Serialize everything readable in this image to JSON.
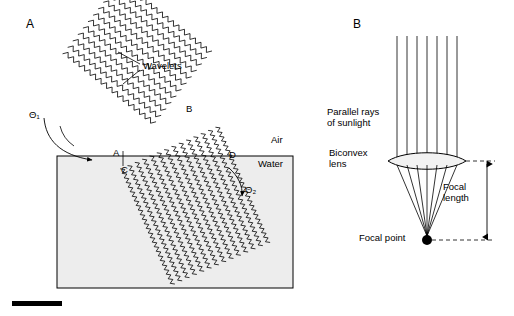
{
  "figure": {
    "width": 514,
    "height": 316,
    "background": "#ffffff",
    "ink": "#000000",
    "water_fill": "#ededed",
    "lens_fill": "#f2f2f2"
  },
  "panelA": {
    "letter": "A",
    "labels": {
      "wavelets": "Wavelets",
      "theta1": "Θ₁",
      "theta2": "Θ₂",
      "point_a": "A",
      "point_b": "B",
      "point_c": "C",
      "point_d": "D",
      "air": "Air",
      "water": "Water"
    }
  },
  "panelB": {
    "letter": "B",
    "labels": {
      "parallel_rays": "Parallel rays\nof sunlight",
      "biconvex_lens": "Biconvex\nlens",
      "focal_length": "Focal\nlength",
      "focal_point": "Focal point"
    },
    "rays_count": 7
  },
  "scalebar": {
    "present": true
  }
}
